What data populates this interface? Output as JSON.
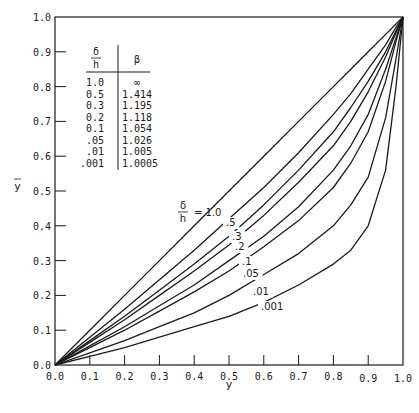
{
  "chart_data": {
    "type": "line",
    "title": "",
    "xlabel": "y",
    "ylabel": "ȳ",
    "xlim": [
      0.0,
      1.0
    ],
    "ylim": [
      0.0,
      1.0
    ],
    "grid": false,
    "legend_position": "inline-labels",
    "x_ticks": [
      "0.0",
      "0.1",
      "0.2",
      "0.3",
      "0.4",
      "0.5",
      "0.6",
      "0.7",
      "0.8",
      "0.9",
      "1.0"
    ],
    "y_ticks": [
      "0.0",
      "0.1",
      "0.2",
      "0.3",
      "0.4",
      "0.5",
      "0.6",
      "0.7",
      "0.8",
      "0.9",
      "1.0"
    ],
    "x": [
      0.0,
      0.1,
      0.2,
      0.3,
      0.4,
      0.5,
      0.6,
      0.7,
      0.8,
      0.85,
      0.9,
      0.95,
      0.98,
      1.0
    ],
    "series": [
      {
        "name": "δ/h = 1.0",
        "label": "1.0",
        "values": [
          0,
          0.1,
          0.2,
          0.3,
          0.4,
          0.5,
          0.6,
          0.7,
          0.8,
          0.85,
          0.9,
          0.95,
          0.98,
          1.0
        ]
      },
      {
        "name": "δ/h = .5",
        "label": ".5",
        "values": [
          0,
          0.08,
          0.16,
          0.245,
          0.33,
          0.42,
          0.51,
          0.61,
          0.72,
          0.78,
          0.85,
          0.92,
          0.97,
          1.0
        ]
      },
      {
        "name": "δ/h = .3",
        "label": ".3",
        "values": [
          0,
          0.07,
          0.14,
          0.215,
          0.29,
          0.37,
          0.46,
          0.56,
          0.67,
          0.74,
          0.815,
          0.9,
          0.96,
          1.0
        ]
      },
      {
        "name": "δ/h = .2",
        "label": ".2",
        "values": [
          0,
          0.065,
          0.13,
          0.2,
          0.27,
          0.345,
          0.43,
          0.525,
          0.63,
          0.7,
          0.785,
          0.885,
          0.955,
          1.0
        ]
      },
      {
        "name": "δ/h = .1",
        "label": ".1",
        "values": [
          0,
          0.055,
          0.11,
          0.17,
          0.23,
          0.3,
          0.37,
          0.455,
          0.56,
          0.63,
          0.72,
          0.85,
          0.94,
          1.0
        ]
      },
      {
        "name": "δ/h = .05",
        "label": ".05",
        "values": [
          0,
          0.05,
          0.1,
          0.155,
          0.21,
          0.27,
          0.34,
          0.415,
          0.51,
          0.58,
          0.67,
          0.815,
          0.93,
          1.0
        ]
      },
      {
        "name": "δ/h = .01",
        "label": ".01",
        "values": [
          0,
          0.035,
          0.07,
          0.11,
          0.15,
          0.2,
          0.26,
          0.32,
          0.4,
          0.46,
          0.54,
          0.71,
          0.88,
          1.0
        ]
      },
      {
        "name": "δ/h = .001",
        "label": ".001",
        "values": [
          0,
          0.025,
          0.05,
          0.08,
          0.11,
          0.14,
          0.18,
          0.23,
          0.29,
          0.33,
          0.4,
          0.56,
          0.8,
          1.0
        ]
      }
    ],
    "annotations": [
      {
        "text": "δ/h = 1.0",
        "position": "inline label on topmost curve"
      }
    ],
    "table": {
      "headers": [
        "δ/h",
        "β"
      ],
      "rows": [
        [
          "1.0",
          "∞"
        ],
        [
          "0.5",
          "1.414"
        ],
        [
          "0.3",
          "1.195"
        ],
        [
          "0.2",
          "1.118"
        ],
        [
          "0.1",
          "1.054"
        ],
        [
          ".05",
          "1.026"
        ],
        [
          ".01",
          "1.005"
        ],
        [
          ".001",
          "1.0005"
        ]
      ]
    }
  },
  "labels": {
    "xlabel": "y",
    "ylabel": "y",
    "delta": "δ",
    "h": "h",
    "beta": "β",
    "eq": "= 1.0"
  },
  "colors": {
    "ink": "#1a1a1a",
    "background": "#ffffff"
  }
}
